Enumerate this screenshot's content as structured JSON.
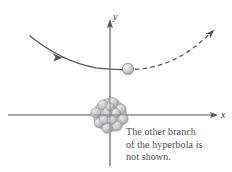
{
  "figure": {
    "background_color": "#ffffff",
    "width": 232,
    "height": 172
  },
  "axes": {
    "x_label": "x",
    "y_label": "y",
    "axis_color": "#55555c",
    "origin": {
      "x": 110,
      "y": 115
    },
    "x_axis": {
      "start_x": 8,
      "end_x": 218,
      "y": 115,
      "arrow": "right"
    },
    "y_axis": {
      "x": 110,
      "start_y": 166,
      "end_y": 20,
      "arrow": "up"
    }
  },
  "trajectory": {
    "solid_branch": {
      "name": "incoming-path",
      "style": "solid",
      "color": "#55555c",
      "arrow": "down-right",
      "points": [
        [
          30,
          36
        ],
        [
          48,
          49
        ],
        [
          66,
          59
        ],
        [
          84,
          65
        ],
        [
          102,
          68
        ],
        [
          120,
          69
        ]
      ]
    },
    "dashed_branch": {
      "name": "outgoing-path",
      "style": "dashed",
      "color": "#55555c",
      "arrow": "up-right",
      "points": [
        [
          136,
          69
        ],
        [
          154,
          67
        ],
        [
          172,
          61
        ],
        [
          188,
          52
        ],
        [
          202,
          41
        ],
        [
          212,
          32
        ]
      ]
    }
  },
  "particle": {
    "label": "alpha-particle",
    "center": {
      "x": 128,
      "y": 69
    },
    "radius": 5.5,
    "fill": "#d7d7d9",
    "stroke": "#8d8d93"
  },
  "nucleus": {
    "label": "nucleus-cluster",
    "center": {
      "x": 110,
      "y": 115
    },
    "radius": 17,
    "fill": "#c9c9cb",
    "stroke": "#8f8f94",
    "nucleon_count": 13
  },
  "caption": {
    "line1": "The other branch",
    "line2": "of the hyperbola is",
    "line3": "not shown."
  },
  "colors": {
    "ink": "#55555c",
    "caption_text": "#4a4a4f",
    "sphere_light": "#e6e6e8",
    "sphere_mid": "#c5c5c8",
    "sphere_dark": "#9a9aa0"
  }
}
